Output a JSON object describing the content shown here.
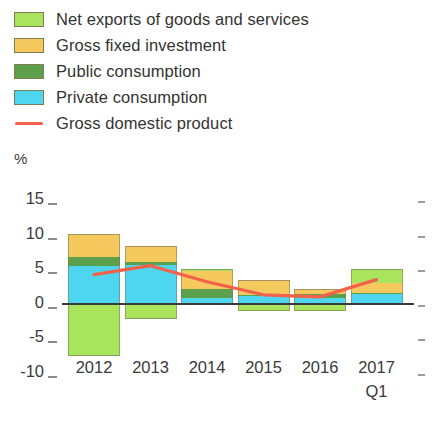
{
  "unit_label": "%",
  "legend": {
    "items": [
      {
        "label": "Net exports of goods and services",
        "color": "#a8e45c",
        "type": "swatch",
        "icon": "legend-swatch-icon"
      },
      {
        "label": "Gross fixed investment",
        "color": "#f6c95e",
        "type": "swatch",
        "icon": "legend-swatch-icon"
      },
      {
        "label": "Public consumption",
        "color": "#5da04b",
        "type": "swatch",
        "icon": "legend-swatch-icon"
      },
      {
        "label": "Private consumption",
        "color": "#4ed6f0",
        "type": "swatch",
        "icon": "legend-swatch-icon"
      },
      {
        "label": "Gross domestic product",
        "color": "#f2614a",
        "type": "line",
        "icon": "legend-line-icon"
      }
    ]
  },
  "axes": {
    "y_ticks": [
      "15",
      "10",
      "5",
      "0",
      "-5",
      "-10"
    ],
    "x_ticks": [
      "2012",
      "2013",
      "2014",
      "2015",
      "2016",
      "2017"
    ],
    "x_sub_tick": "Q1"
  },
  "chart_data": {
    "type": "bar",
    "title": "",
    "subtitle": "",
    "xlabel": "",
    "ylabel": "%",
    "ylim": [
      -10,
      15
    ],
    "grid": false,
    "stacked": true,
    "legend_position": "top-left",
    "categories": [
      "2012",
      "2013",
      "2014",
      "2015",
      "2016",
      "2017 Q1"
    ],
    "series": [
      {
        "name": "Private consumption",
        "color": "#4ed6f0",
        "values": [
          5.4,
          5.6,
          0.9,
          1.1,
          0.9,
          1.4
        ]
      },
      {
        "name": "Public consumption",
        "color": "#5da04b",
        "values": [
          1.4,
          0.5,
          1.3,
          0.2,
          0.5,
          0.2
        ]
      },
      {
        "name": "Gross fixed investment",
        "color": "#f6c95e",
        "values": [
          3.3,
          2.3,
          2.5,
          2.1,
          0.8,
          1.4
        ]
      },
      {
        "name": "Net exports of goods and services",
        "color": "#a8e45c",
        "values": [
          -7.6,
          -2.2,
          0.4,
          -1.1,
          -1.0,
          2.0
        ]
      }
    ],
    "line_series": {
      "name": "Gross domestic product",
      "color": "#f2614a",
      "values": [
        4.2,
        5.5,
        3.2,
        1.3,
        1.0,
        3.5
      ]
    }
  }
}
